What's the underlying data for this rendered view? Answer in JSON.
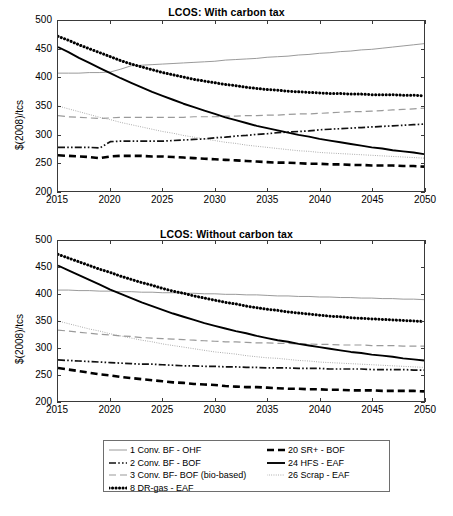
{
  "figure": {
    "ylabel": "$(2008)/tcs",
    "yticks": [
      500,
      450,
      400,
      350,
      300,
      250,
      200
    ],
    "xticks": [
      2015,
      2020,
      2025,
      2030,
      2035,
      2040,
      2045,
      2050
    ]
  },
  "legend": {
    "left_items": [
      {
        "label": "1 Conv. BF - OHF",
        "style": "thin-gray-solid"
      },
      {
        "label": "2 Conv. BF - BOF",
        "style": "black-dashdot"
      },
      {
        "label": "3 Conv. BF- BOF (bio-based)",
        "style": "gray-dashed"
      },
      {
        "label": "8 DR-gas - EAF",
        "style": "bold-dotted"
      }
    ],
    "right_items": [
      {
        "label": "20 SR+ - BOF",
        "style": "bold-dashed"
      },
      {
        "label": "24 HFS - EAF",
        "style": "black-solid"
      },
      {
        "label": "26 Scrap - EAF",
        "style": "light-dotted"
      }
    ]
  },
  "chart_data": [
    {
      "type": "line",
      "title": "LCOS: With carbon tax",
      "xlabel": "",
      "ylabel": "$(2008)/tcs",
      "xlim": [
        2015,
        2050
      ],
      "ylim": [
        200,
        500
      ],
      "grid": false,
      "legend_position": "below-figure",
      "x": [
        2015,
        2016,
        2017,
        2018,
        2019,
        2020,
        2021,
        2022,
        2023,
        2024,
        2025,
        2026,
        2027,
        2028,
        2029,
        2030,
        2031,
        2032,
        2033,
        2034,
        2035,
        2036,
        2037,
        2038,
        2039,
        2040,
        2041,
        2042,
        2043,
        2044,
        2045,
        2046,
        2047,
        2048,
        2049,
        2050
      ],
      "series": [
        {
          "name": "1 Conv. BF - OHF",
          "style": "thin-gray-solid",
          "values": [
            408,
            408,
            408,
            409,
            409,
            410,
            415,
            421,
            422,
            423,
            424,
            425,
            426,
            427,
            428,
            429,
            431,
            432,
            433,
            434,
            436,
            437,
            438,
            440,
            441,
            443,
            444,
            446,
            447,
            449,
            450,
            452,
            454,
            456,
            458,
            460
          ]
        },
        {
          "name": "2 Conv. BF - BOF",
          "style": "black-dashdot",
          "values": [
            277,
            277,
            277,
            277,
            276,
            287,
            288,
            288,
            288,
            288,
            288,
            289,
            290,
            291,
            292,
            294,
            295,
            297,
            298,
            300,
            301,
            303,
            304,
            305,
            306,
            308,
            309,
            310,
            311,
            312,
            313,
            314,
            315,
            316,
            317,
            318
          ]
        },
        {
          "name": "3 Conv. BF- BOF (bio-based)",
          "style": "gray-dashed",
          "values": [
            333,
            331,
            330,
            329,
            328,
            329,
            330,
            330,
            330,
            330,
            330,
            330,
            330,
            331,
            331,
            331,
            332,
            332,
            333,
            333,
            334,
            334,
            335,
            336,
            336,
            337,
            338,
            339,
            340,
            340,
            341,
            342,
            343,
            344,
            345,
            346
          ]
        },
        {
          "name": "8 DR-gas - EAF",
          "style": "bold-dotted",
          "values": [
            473,
            466,
            458,
            451,
            444,
            437,
            430,
            424,
            419,
            414,
            409,
            405,
            401,
            397,
            394,
            391,
            388,
            386,
            383,
            381,
            379,
            378,
            376,
            375,
            374,
            373,
            372,
            372,
            371,
            371,
            370,
            370,
            370,
            369,
            369,
            368
          ]
        },
        {
          "name": "20 SR+ - BOF",
          "style": "bold-dashed",
          "values": [
            263,
            262,
            261,
            260,
            258,
            261,
            262,
            262,
            262,
            261,
            261,
            260,
            259,
            258,
            257,
            256,
            255,
            254,
            253,
            252,
            251,
            250,
            250,
            249,
            248,
            248,
            247,
            247,
            246,
            246,
            245,
            245,
            245,
            244,
            244,
            243
          ]
        },
        {
          "name": "24 HFS - EAF",
          "style": "black-solid",
          "values": [
            454,
            445,
            435,
            426,
            417,
            408,
            399,
            391,
            383,
            375,
            368,
            361,
            354,
            348,
            342,
            336,
            330,
            325,
            320,
            315,
            311,
            307,
            303,
            299,
            296,
            292,
            289,
            286,
            283,
            280,
            277,
            275,
            272,
            270,
            268,
            265
          ]
        },
        {
          "name": "26 Scrap - EAF",
          "style": "light-dotted",
          "values": [
            350,
            345,
            340,
            335,
            330,
            326,
            321,
            317,
            313,
            309,
            305,
            302,
            298,
            295,
            292,
            289,
            286,
            284,
            281,
            279,
            277,
            275,
            273,
            271,
            270,
            268,
            267,
            266,
            265,
            264,
            263,
            262,
            261,
            260,
            259,
            258
          ]
        }
      ]
    },
    {
      "type": "line",
      "title": "LCOS: Without carbon tax",
      "xlabel": "",
      "ylabel": "$(2008)/tcs",
      "xlim": [
        2015,
        2050
      ],
      "ylim": [
        200,
        500
      ],
      "grid": false,
      "legend_position": "below-figure",
      "x": [
        2015,
        2016,
        2017,
        2018,
        2019,
        2020,
        2021,
        2022,
        2023,
        2024,
        2025,
        2026,
        2027,
        2028,
        2029,
        2030,
        2031,
        2032,
        2033,
        2034,
        2035,
        2036,
        2037,
        2038,
        2039,
        2040,
        2041,
        2042,
        2043,
        2044,
        2045,
        2046,
        2047,
        2048,
        2049,
        2050
      ],
      "series": [
        {
          "name": "1 Conv. BF - OHF",
          "style": "thin-gray-solid",
          "values": [
            408,
            408,
            407,
            407,
            406,
            406,
            405,
            405,
            404,
            404,
            403,
            403,
            402,
            402,
            401,
            401,
            400,
            400,
            399,
            399,
            398,
            397,
            397,
            396,
            396,
            395,
            395,
            394,
            394,
            393,
            393,
            392,
            392,
            391,
            391,
            390
          ]
        },
        {
          "name": "2 Conv. BF - BOF",
          "style": "black-dashdot",
          "values": [
            277,
            276,
            275,
            274,
            273,
            272,
            271,
            270,
            269,
            269,
            268,
            267,
            266,
            266,
            265,
            265,
            264,
            264,
            263,
            263,
            262,
            262,
            262,
            261,
            261,
            261,
            260,
            260,
            260,
            260,
            259,
            259,
            259,
            259,
            258,
            258
          ]
        },
        {
          "name": "3 Conv. BF- BOF (bio-based)",
          "style": "gray-dashed",
          "values": [
            333,
            331,
            329,
            327,
            325,
            324,
            322,
            321,
            319,
            318,
            317,
            316,
            315,
            314,
            313,
            312,
            311,
            311,
            310,
            309,
            309,
            308,
            308,
            307,
            307,
            306,
            306,
            305,
            305,
            305,
            304,
            304,
            304,
            303,
            303,
            303
          ]
        },
        {
          "name": "8 DR-gas - EAF",
          "style": "bold-dotted",
          "values": [
            475,
            468,
            461,
            454,
            447,
            441,
            434,
            428,
            422,
            417,
            411,
            406,
            402,
            397,
            393,
            389,
            385,
            382,
            378,
            375,
            372,
            370,
            367,
            365,
            363,
            361,
            359,
            358,
            356,
            355,
            354,
            353,
            352,
            351,
            350,
            349
          ]
        },
        {
          "name": "20 SR+ - BOF",
          "style": "bold-dashed",
          "values": [
            262,
            259,
            256,
            253,
            250,
            248,
            245,
            243,
            241,
            239,
            237,
            235,
            234,
            232,
            231,
            230,
            228,
            227,
            226,
            226,
            225,
            224,
            223,
            223,
            222,
            222,
            221,
            221,
            220,
            220,
            220,
            219,
            219,
            219,
            219,
            218
          ]
        },
        {
          "name": "24 HFS - EAF",
          "style": "black-solid",
          "values": [
            454,
            445,
            436,
            427,
            418,
            409,
            401,
            393,
            385,
            378,
            371,
            364,
            358,
            352,
            346,
            341,
            336,
            331,
            327,
            322,
            318,
            314,
            311,
            307,
            304,
            301,
            298,
            295,
            292,
            290,
            287,
            285,
            283,
            280,
            278,
            276
          ]
        },
        {
          "name": "26 Scrap - EAF",
          "style": "light-dotted",
          "values": [
            350,
            345,
            340,
            335,
            331,
            326,
            322,
            318,
            314,
            311,
            307,
            304,
            301,
            298,
            295,
            292,
            290,
            288,
            285,
            283,
            281,
            280,
            278,
            276,
            275,
            273,
            272,
            271,
            270,
            269,
            268,
            267,
            266,
            265,
            264,
            263
          ]
        }
      ]
    }
  ]
}
